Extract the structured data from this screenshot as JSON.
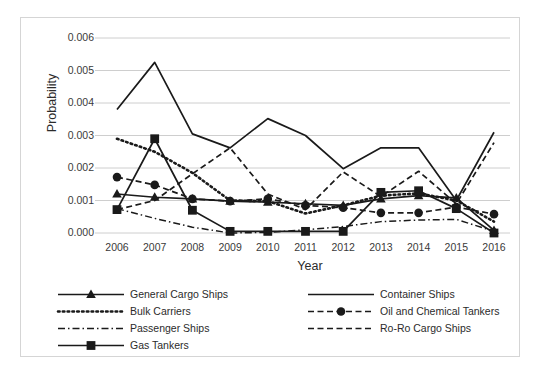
{
  "chart_data": {
    "type": "line",
    "title": "",
    "xlabel": "Year",
    "ylabel": "Probability",
    "categories": [
      2006,
      2007,
      2008,
      2009,
      2010,
      2011,
      2012,
      2013,
      2014,
      2015,
      2016
    ],
    "xticklabels": [
      "2006",
      "2007",
      "2008",
      "2009",
      "2010",
      "2011",
      "2012",
      "2013",
      "2014",
      "2015",
      "2016"
    ],
    "yticklabels": [
      "0.000",
      "0.001",
      "0.002",
      "0.003",
      "0.004",
      "0.005",
      "0.006"
    ],
    "ytickvalues": [
      0.0,
      0.001,
      0.002,
      0.003,
      0.004,
      0.005,
      0.006
    ],
    "ylim": [
      0.0,
      0.006
    ],
    "grid": "horizontal",
    "legend_position": "bottom",
    "series": [
      {
        "name": "General Cargo Ships",
        "style": "solid",
        "marker": "triangle",
        "values": [
          0.0012,
          0.0011,
          0.00105,
          0.00098,
          0.00095,
          0.0009,
          0.00085,
          0.00105,
          0.00115,
          0.00108,
          8e-05
        ]
      },
      {
        "name": "Container Ships",
        "style": "solid",
        "marker": "none",
        "values": [
          0.0038,
          0.00525,
          0.00305,
          0.00262,
          0.00352,
          0.003,
          0.00198,
          0.00262,
          0.00262,
          0.001,
          0.0031
        ]
      },
      {
        "name": "Bulk Carriers",
        "style": "dotted",
        "marker": "none",
        "values": [
          0.0029,
          0.0025,
          0.00185,
          0.001,
          0.00098,
          0.0006,
          0.00085,
          0.00115,
          0.00122,
          0.001,
          0.00035
        ]
      },
      {
        "name": "Oil and Chemical Tankers",
        "style": "dashed",
        "marker": "circle",
        "values": [
          0.00172,
          0.00148,
          0.00105,
          0.00098,
          0.00105,
          0.00085,
          0.00078,
          0.00062,
          0.00062,
          0.0008,
          0.00058
        ]
      },
      {
        "name": "Passenger Ships",
        "style": "dashdot",
        "marker": "none",
        "values": [
          0.00075,
          0.00045,
          0.00018,
          0.0,
          2e-05,
          0.0001,
          0.0002,
          0.00035,
          0.0004,
          0.00042,
          5e-05
        ]
      },
      {
        "name": "Ro-Ro Cargo Ships",
        "style": "dashed",
        "marker": "none",
        "values": [
          0.00072,
          0.001,
          0.00182,
          0.00262,
          0.0012,
          0.00072,
          0.00188,
          0.00112,
          0.0019,
          0.0009,
          0.00278
        ]
      },
      {
        "name": "Gas Tankers",
        "style": "solid",
        "marker": "square",
        "values": [
          0.00072,
          0.0029,
          0.0007,
          5e-05,
          5e-05,
          5e-05,
          5e-05,
          0.00125,
          0.0013,
          0.00075,
          0.0
        ]
      }
    ],
    "legend": [
      {
        "label": "General Cargo Ships",
        "style": "solid",
        "marker": "triangle"
      },
      {
        "label": "Container Ships",
        "style": "solid",
        "marker": "none"
      },
      {
        "label": "Bulk Carriers",
        "style": "dotted",
        "marker": "none"
      },
      {
        "label": "Oil and Chemical Tankers",
        "style": "dashed",
        "marker": "circle"
      },
      {
        "label": "Passenger Ships",
        "style": "dashdot",
        "marker": "none"
      },
      {
        "label": "Ro-Ro Cargo Ships",
        "style": "dashed",
        "marker": "none"
      },
      {
        "label": "Gas Tankers",
        "style": "solid",
        "marker": "square"
      }
    ],
    "colors": {
      "line": "#1a1a1a",
      "grid": "#c8c8c8",
      "border": "#d5d5d5",
      "text": "#2b2b2b",
      "background": "#ffffff"
    }
  }
}
